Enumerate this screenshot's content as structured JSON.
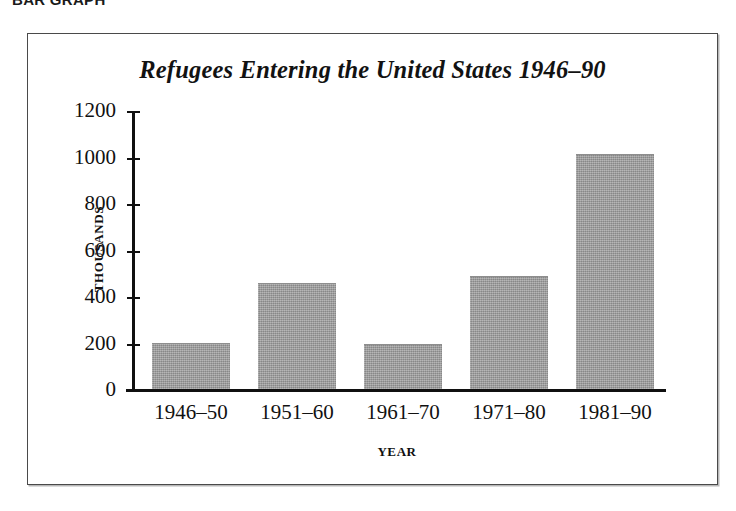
{
  "caption": {
    "text": "BAR GRAPH"
  },
  "figure": {
    "frame_color": "#4a4a4a",
    "background": "#ffffff"
  },
  "chart_data": {
    "type": "bar",
    "title": "Refugees Entering the United States 1946–90",
    "xlabel": "YEAR",
    "ylabel": "THOUSANDS",
    "categories": [
      "1946–50",
      "1951–60",
      "1961–70",
      "1971–80",
      "1981–90"
    ],
    "values": [
      200,
      455,
      195,
      485,
      1010
    ],
    "ylim": [
      0,
      1200
    ],
    "ytick_labels": [
      "0",
      "200",
      "400",
      "600",
      "800",
      "1000",
      "1200"
    ],
    "ytick_values": [
      0,
      200,
      400,
      600,
      800,
      1000,
      1200
    ],
    "grid": false,
    "legend": null,
    "bar_color": "#9b9b9b",
    "axis_color": "#101010"
  }
}
